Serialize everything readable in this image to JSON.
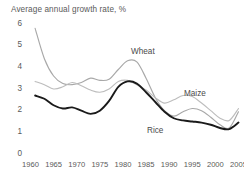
{
  "chart_data": {
    "type": "line",
    "title": "Average annual growth rate, %",
    "xlabel": "",
    "ylabel": "",
    "xlim": [
      1960,
      2005
    ],
    "ylim": [
      0,
      6
    ],
    "yticks": [
      0,
      1,
      2,
      3,
      4,
      5,
      6
    ],
    "xticks": [
      1960,
      1965,
      1970,
      1975,
      1980,
      1985,
      1990,
      1995,
      2000,
      2005
    ],
    "grid": false,
    "legend_position": "inline-annotations",
    "x": [
      1961,
      1963,
      1965,
      1967,
      1969,
      1971,
      1973,
      1975,
      1977,
      1979,
      1981,
      1983,
      1985,
      1987,
      1989,
      1991,
      1993,
      1995,
      1997,
      1999,
      2001,
      2003,
      2005
    ],
    "series": [
      {
        "name": "Wheat",
        "color": "#a8a8a8",
        "values": [
          5.8,
          4.4,
          3.6,
          3.25,
          3.2,
          3.3,
          3.5,
          3.4,
          3.45,
          3.9,
          4.3,
          4.25,
          3.5,
          2.6,
          2.0,
          1.75,
          1.95,
          2.1,
          2.0,
          1.7,
          1.35,
          1.2,
          1.95
        ]
      },
      {
        "name": "Maize",
        "color": "#bdbdbd",
        "values": [
          3.35,
          3.2,
          3.0,
          3.1,
          3.3,
          3.15,
          2.95,
          2.85,
          3.0,
          3.35,
          3.4,
          3.2,
          2.95,
          2.6,
          2.35,
          2.5,
          2.7,
          2.65,
          2.35,
          2.0,
          1.65,
          1.55,
          2.1
        ]
      },
      {
        "name": "Rice",
        "color": "#1a1a1a",
        "values": [
          2.7,
          2.55,
          2.25,
          2.1,
          2.15,
          2.0,
          1.85,
          2.0,
          2.45,
          3.1,
          3.35,
          3.25,
          2.85,
          2.4,
          1.95,
          1.65,
          1.55,
          1.5,
          1.45,
          1.35,
          1.2,
          1.15,
          1.45
        ]
      }
    ],
    "annotations": [
      {
        "text": "Wheat",
        "x_px": 131,
        "y_px": 48
      },
      {
        "text": "Maize",
        "x_px": 184,
        "y_px": 90
      },
      {
        "text": "Rice",
        "x_px": 147,
        "y_px": 127
      }
    ]
  }
}
